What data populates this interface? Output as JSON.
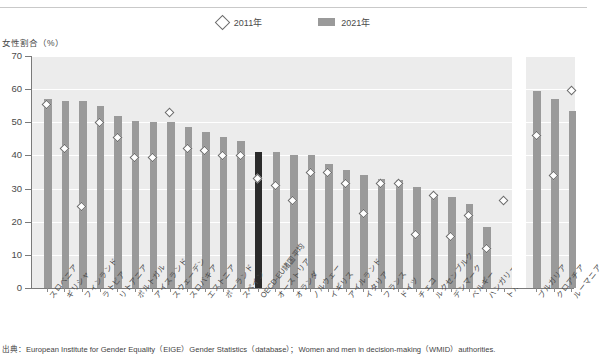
{
  "legend": {
    "items": [
      {
        "label": "2011年",
        "marker": "diamond-icon"
      },
      {
        "label": "2021年",
        "marker": "bar-swatch-icon"
      }
    ]
  },
  "source": {
    "text": "出典：European Institute for Gender Equality（EIGE）Gender Statistics（database）；Women and men in decision-making（WMID）authorities."
  },
  "chart_data": {
    "type": "bar",
    "title": "",
    "ylabel": "女性割合（%）",
    "xlabel": "",
    "ylim": [
      0,
      70
    ],
    "yticks": [
      0,
      10,
      20,
      30,
      40,
      50,
      60,
      70
    ],
    "grid": true,
    "legend_position": "top-center",
    "highlight_category": "OECD-EU諸国平均",
    "highlight_color": "#2b2b2b",
    "bar_color": "#9a9a9a",
    "marker_color": "#ffffff",
    "plot_background": "#ececec",
    "categories": [
      "スロベニア",
      "ギリシャ",
      "フィンランド",
      "ラトビア",
      "リトアニア",
      "ポルトガル",
      "アイスランド",
      "スウェーデン",
      "スロバキア",
      "エストニア",
      "ポーランド",
      "スペイン",
      "OECD-EU諸国平均",
      "オーストリア",
      "オランダ",
      "ノルウェー",
      "イギリス",
      "アイルランド",
      "イタリア",
      "フランス",
      "ドイツ",
      "チェコ",
      "ルクセンブルク",
      "デンマーク",
      "ベルギー",
      "ハンガリー",
      "トルコ",
      "ブルガリア",
      "クロアチア",
      "ルーマニア"
    ],
    "group_break_after": "トルコ",
    "series": [
      {
        "name": "2021年",
        "type": "bar",
        "values": [
          57.0,
          56.5,
          56.5,
          55.0,
          52.0,
          50.5,
          50.0,
          50.0,
          48.5,
          47.0,
          45.5,
          44.5,
          41.0,
          41.0,
          40.0,
          40.0,
          37.5,
          35.5,
          34.0,
          33.0,
          32.5,
          30.5,
          28.5,
          27.5,
          25.5,
          18.5,
          0.0,
          59.5,
          57.0,
          53.5
        ]
      },
      {
        "name": "2011年",
        "type": "scatter",
        "values": [
          55.5,
          42.0,
          24.5,
          50.0,
          45.5,
          39.5,
          39.5,
          53.0,
          42.0,
          41.5,
          40.0,
          40.0,
          33.0,
          31.0,
          26.5,
          35.0,
          35.0,
          31.5,
          22.5,
          31.5,
          31.5,
          16.0,
          28.0,
          15.5,
          22.0,
          12.0,
          26.5,
          46.0,
          34.0,
          59.5
        ]
      }
    ]
  }
}
